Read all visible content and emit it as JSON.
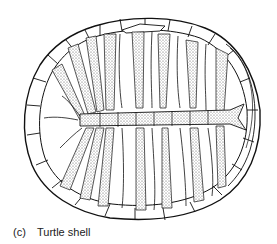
{
  "figure": {
    "caption": {
      "label": "(c)",
      "text": "Turtle shell"
    },
    "colors": {
      "line": "#111111",
      "stipple": "#8a8a8a",
      "background": "#ffffff"
    }
  }
}
